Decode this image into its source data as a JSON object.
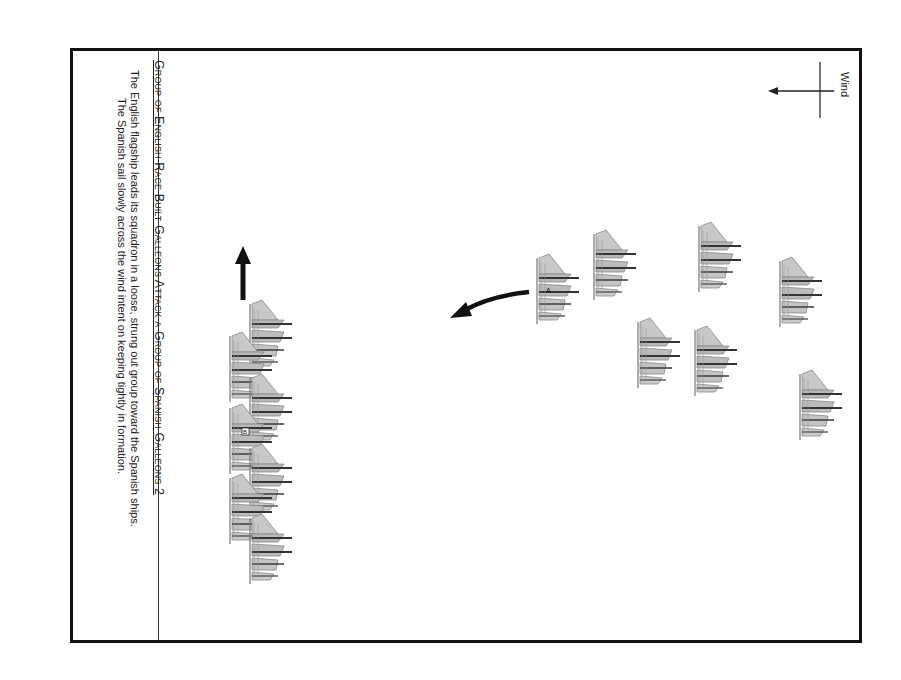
{
  "diagram": {
    "title": "Group of English Race Built Galleons Attack a Group of  Spanish Galleons 2",
    "caption_lines": [
      "The English flagship leads its squadron in a loose, strung out group toward the Spanish ships.",
      "The Spanish sail slowly across the wind intent on keeping tightly in formation."
    ],
    "wind": {
      "label": "Wind",
      "direction": "left"
    },
    "colors": {
      "border": "#111111",
      "ink": "#222222",
      "ship_fill": "#9a9a9a",
      "background": "#ffffff"
    },
    "english_squadron": {
      "label": "English race built galleons",
      "flagship_marker": "B",
      "heading_arrow": "up",
      "ships": [
        {
          "x": 248,
          "y": 298
        },
        {
          "x": 228,
          "y": 330
        },
        {
          "x": 248,
          "y": 372
        },
        {
          "x": 228,
          "y": 402,
          "flagship": true
        },
        {
          "x": 248,
          "y": 442
        },
        {
          "x": 228,
          "y": 472
        },
        {
          "x": 248,
          "y": 512
        }
      ]
    },
    "spanish_squadron": {
      "label": "Spanish galleons",
      "flagship_marker": "A",
      "turn_arrow": "curved-left",
      "ships": [
        {
          "x": 535,
          "y": 250,
          "flagship": true
        },
        {
          "x": 592,
          "y": 228
        },
        {
          "x": 697,
          "y": 220
        },
        {
          "x": 778,
          "y": 255
        },
        {
          "x": 636,
          "y": 315
        },
        {
          "x": 693,
          "y": 323
        },
        {
          "x": 798,
          "y": 368
        }
      ]
    }
  }
}
